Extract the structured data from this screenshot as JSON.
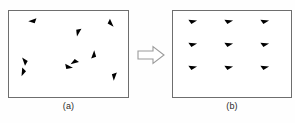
{
  "figure": {
    "type": "scientific-diagram",
    "colors": {
      "panel_border": "#6e6e6e",
      "ring_stroke": "#111111",
      "arrowhead_fill": "#000000",
      "background": "#ffffff",
      "transition_arrow_stroke": "#9a9a9a",
      "transition_arrow_fill": "#ffffff",
      "caption_text": "#2b2b2b"
    }
  },
  "panel_a": {
    "label": "(a)",
    "state_name": "disordered",
    "grid": {
      "rows": 3,
      "columns": 3
    },
    "circles": [
      {
        "row": 1,
        "col": 1,
        "arrowhead_angle_deg": 95,
        "clock_position": "12 o'clock",
        "sense": "counterclockwise"
      },
      {
        "row": 1,
        "col": 2,
        "arrowhead_angle_deg": -15,
        "clock_position": "3-4 o'clock",
        "sense": "clockwise"
      },
      {
        "row": 1,
        "col": 3,
        "arrowhead_angle_deg": 40,
        "clock_position": "2 o'clock",
        "sense": "clockwise"
      },
      {
        "row": 2,
        "col": 1,
        "arrowhead_angle_deg": 215,
        "clock_position": "7-8 o'clock",
        "sense": "clockwise"
      },
      {
        "row": 2,
        "col": 2,
        "arrowhead_angle_deg": -60,
        "clock_position": "4-5 o'clock",
        "sense": "clockwise"
      },
      {
        "row": 2,
        "col": 3,
        "arrowhead_angle_deg": 175,
        "clock_position": "9 o'clock",
        "sense": "clockwise"
      },
      {
        "row": 3,
        "col": 1,
        "arrowhead_angle_deg": 160,
        "clock_position": "9-10 o'clock",
        "sense": "counterclockwise"
      },
      {
        "row": 3,
        "col": 2,
        "arrowhead_angle_deg": 78,
        "clock_position": "11-12 o'clock",
        "sense": "clockwise"
      },
      {
        "row": 3,
        "col": 3,
        "arrowhead_angle_deg": -5,
        "clock_position": "3 o'clock",
        "sense": "clockwise"
      }
    ]
  },
  "panel_b": {
    "label": "(b)",
    "state_name": "aligned",
    "grid": {
      "rows": 3,
      "columns": 3
    },
    "circles": [
      {
        "row": 1,
        "col": 1,
        "arrowhead_angle_deg": 100,
        "clock_position": "11-12 o'clock",
        "sense": "clockwise"
      },
      {
        "row": 1,
        "col": 2,
        "arrowhead_angle_deg": 100,
        "clock_position": "11-12 o'clock",
        "sense": "clockwise"
      },
      {
        "row": 1,
        "col": 3,
        "arrowhead_angle_deg": 100,
        "clock_position": "11-12 o'clock",
        "sense": "clockwise"
      },
      {
        "row": 2,
        "col": 1,
        "arrowhead_angle_deg": 100,
        "clock_position": "11-12 o'clock",
        "sense": "clockwise"
      },
      {
        "row": 2,
        "col": 2,
        "arrowhead_angle_deg": 100,
        "clock_position": "11-12 o'clock",
        "sense": "clockwise"
      },
      {
        "row": 2,
        "col": 3,
        "arrowhead_angle_deg": 100,
        "clock_position": "11-12 o'clock",
        "sense": "clockwise"
      },
      {
        "row": 3,
        "col": 1,
        "arrowhead_angle_deg": 100,
        "clock_position": "11-12 o'clock",
        "sense": "clockwise"
      },
      {
        "row": 3,
        "col": 2,
        "arrowhead_angle_deg": 100,
        "clock_position": "11-12 o'clock",
        "sense": "clockwise"
      },
      {
        "row": 3,
        "col": 3,
        "arrowhead_angle_deg": 100,
        "clock_position": "11-12 o'clock",
        "sense": "clockwise"
      }
    ]
  },
  "transition": {
    "icon": "block-right-arrow-icon",
    "direction": "right",
    "meaning": "transforms into"
  }
}
